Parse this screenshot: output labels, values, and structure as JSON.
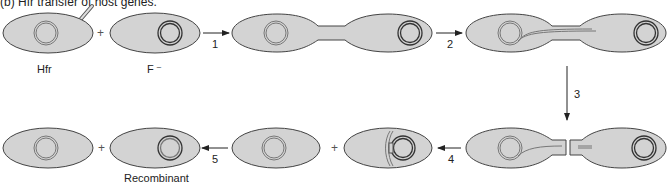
{
  "figure": {
    "title": "(b) Hfr transfer of host genes.",
    "colors": {
      "cell_fill": "#d3d3d3",
      "cell_stroke": "#444444",
      "chromosome_stroke": "#555555",
      "arrow": "#222222"
    },
    "labels": {
      "hfr": "Hfr",
      "f_minus": "F ⁻",
      "recombinant": "Recombinant"
    },
    "operators": {
      "plus": "+"
    },
    "steps": [
      {
        "number": "1",
        "description": "Hfr and F- cells form conjugation bridge"
      },
      {
        "number": "2",
        "description": "Hfr chromosome strand transferred through bridge"
      },
      {
        "number": "3",
        "description": "Cells separate, bridge breaks"
      },
      {
        "number": "4",
        "description": "Transferred DNA aligns with F- chromosome"
      },
      {
        "number": "5",
        "description": "Recombination produces recombinant cell"
      }
    ]
  }
}
